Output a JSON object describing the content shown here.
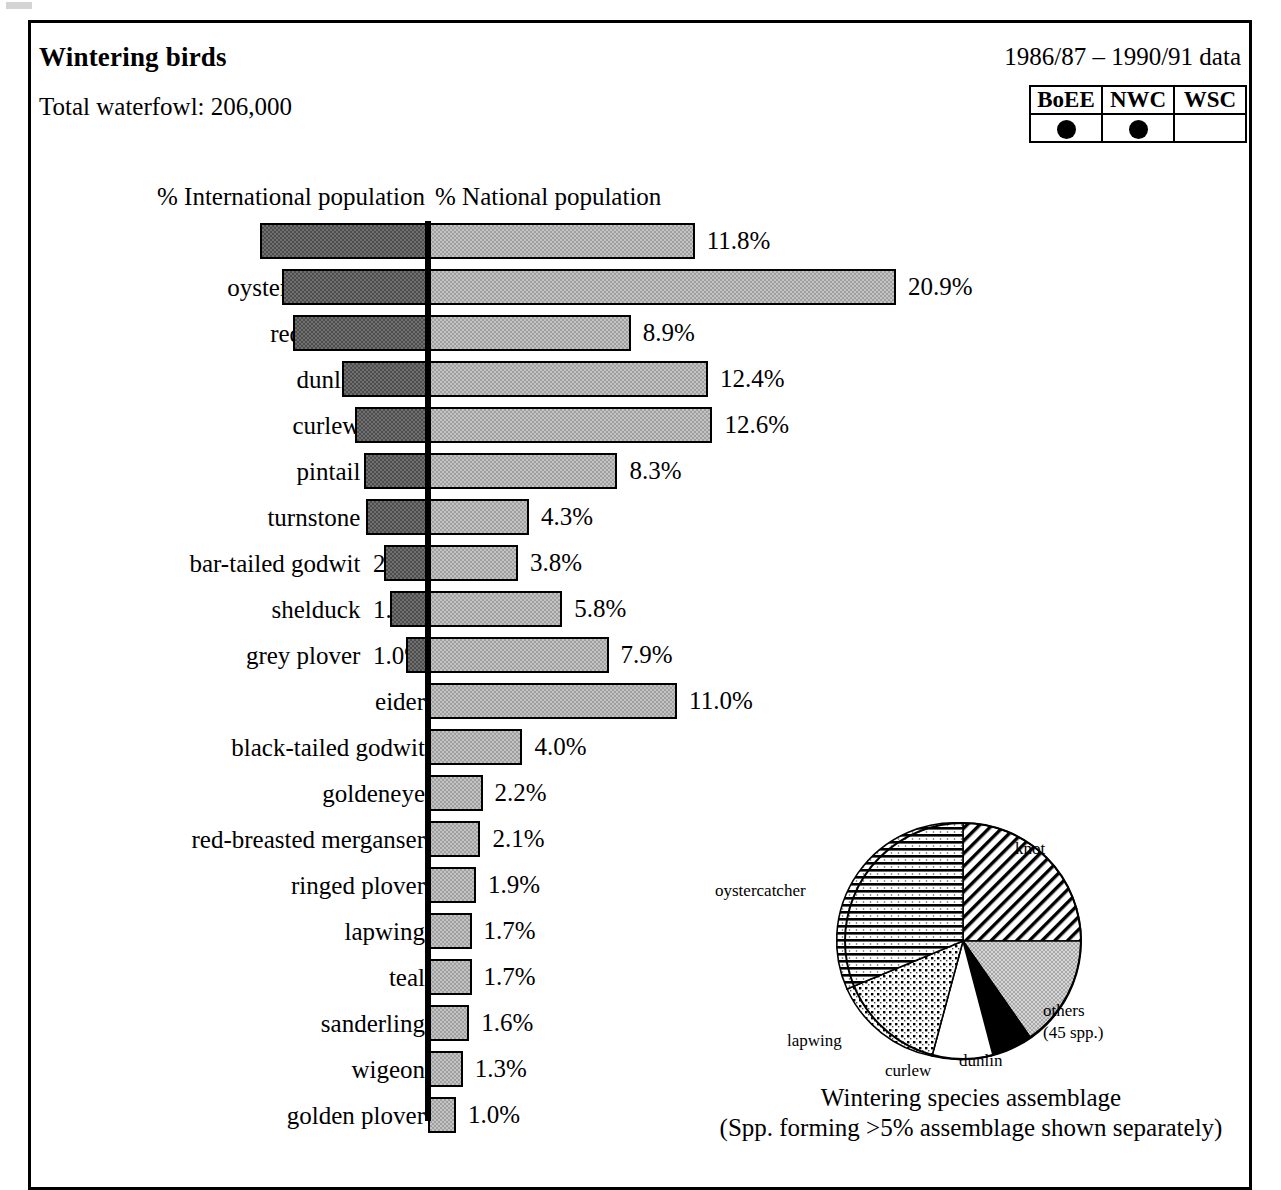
{
  "header": {
    "title": "Wintering birds",
    "total_waterfowl": "Total waterfowl: 206,000",
    "years": "1986/87 – 1990/91 data"
  },
  "survey_legend": {
    "columns": [
      "BoEE",
      "NWC",
      "WSC"
    ],
    "marked": [
      true,
      true,
      false
    ],
    "mark_icon": "filled-circle"
  },
  "axis_labels": {
    "left": "% International population",
    "right": "% National population"
  },
  "chart_data": {
    "type": "bar",
    "orientation": "horizontal-diverging",
    "title": "Wintering birds",
    "subtitle": "Total waterfowl: 206,000",
    "xlabel_left": "% International population",
    "xlabel_right": "% National population",
    "ylabel": "",
    "grid": false,
    "legend": "none",
    "xlim_left": [
      0,
      8
    ],
    "xlim_right": [
      0,
      21
    ],
    "categories": [
      "knot",
      "oystercatcher",
      "redshank",
      "dunlin",
      "curlew",
      "pintail",
      "turnstone",
      "bar-tailed godwit",
      "shelduck",
      "grey plover",
      "eider",
      "black-tailed godwit",
      "goldeneye",
      "red-breasted merganser",
      "ringed plover",
      "lapwing",
      "teal",
      "sanderling",
      "wigeon",
      "golden plover"
    ],
    "series": [
      {
        "name": "% International population",
        "values": [
          7.6,
          6.6,
          6.1,
          3.9,
          3.3,
          2.9,
          2.8,
          2.0,
          1.7,
          1.0,
          null,
          null,
          null,
          null,
          null,
          null,
          null,
          null,
          null,
          null
        ],
        "labels": [
          "7.6%",
          "6.6%",
          "6.1%",
          "3.9%",
          "3.3%",
          "2.9%",
          "2.8%",
          "2.0%",
          "1.7%",
          "1.0%",
          "",
          "",
          "",
          "",
          "",
          "",
          "",
          "",
          "",
          ""
        ]
      },
      {
        "name": "% National population",
        "values": [
          11.8,
          20.9,
          8.9,
          12.4,
          12.6,
          8.3,
          4.3,
          3.8,
          5.8,
          7.9,
          11.0,
          4.0,
          2.2,
          2.1,
          1.9,
          1.7,
          1.7,
          1.6,
          1.3,
          1.0
        ],
        "labels": [
          "11.8%",
          "20.9%",
          "8.9%",
          "12.4%",
          "12.6%",
          "8.3%",
          "4.3%",
          "3.8%",
          "5.8%",
          "7.9%",
          "11.0%",
          "4.0%",
          "2.2%",
          "2.1%",
          "1.9%",
          "1.7%",
          "1.7%",
          "1.6%",
          "1.3%",
          "1.0%"
        ]
      }
    ]
  },
  "pie_chart": {
    "type": "pie",
    "title": "Wintering species assemblage",
    "subtitle": "(Spp. forming >5% assemblage shown separately)",
    "slices": [
      {
        "label": "knot",
        "percent": 25.0,
        "pattern": "diagonal-hatch"
      },
      {
        "label": "others\n(45 spp.)",
        "percent": 19.5,
        "pattern": "light-stipple"
      },
      {
        "label": "dunlin",
        "percent": 5.5,
        "pattern": "solid-black"
      },
      {
        "label": "curlew",
        "percent": 7.0,
        "pattern": "white"
      },
      {
        "label": "lapwing",
        "percent": 13.0,
        "pattern": "cross-hatch-dots"
      },
      {
        "label": "oystercatcher",
        "percent": 30.0,
        "pattern": "horizontal-hatch"
      }
    ],
    "labels": {
      "knot": "knot",
      "others_line1": "others",
      "others_line2": "(45 spp.)",
      "dunlin": "dunlin",
      "curlew": "curlew",
      "lapwing": "lapwing",
      "oystercatcher": "oystercatcher"
    },
    "caption_line1": "Wintering species assemblage",
    "caption_line2": "(Spp. forming >5% assemblage shown separately)"
  },
  "colors": {
    "international_bar": "#6f6f6f",
    "national_bar": "#c3c3c3",
    "axis": "#000000",
    "border": "#000000"
  }
}
